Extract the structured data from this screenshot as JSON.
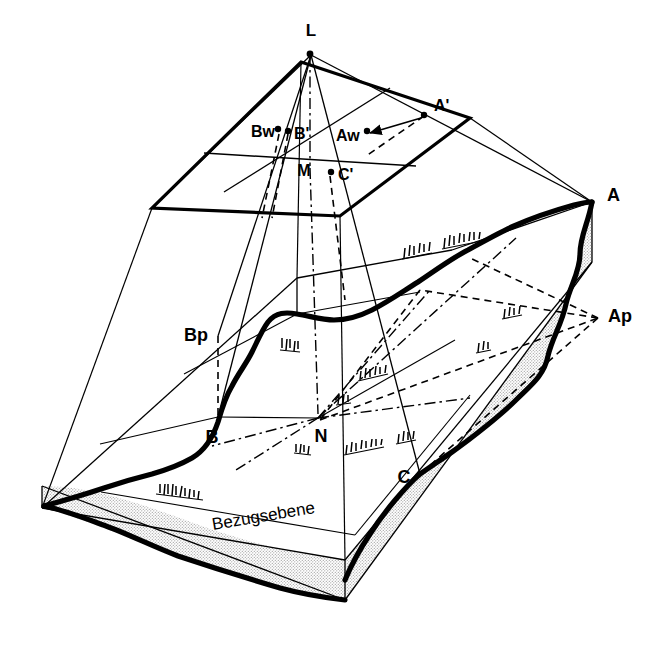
{
  "figure": {
    "domain_note": "photogrammetric central-projection block diagram",
    "background_color": "#ffffff",
    "ink_color": "#000000",
    "stipple_color": "#b8b8b8"
  },
  "labels": {
    "projection_center": "L",
    "image_plane_center": "M",
    "image_point_a": "A'",
    "image_point_b": "B'",
    "image_point_c": "C'",
    "warped_point_a": "Aw",
    "warped_point_b": "Bw",
    "terrain_point_a": "A",
    "terrain_point_b": "B",
    "terrain_point_c": "C",
    "projected_point_a": "Ap",
    "projected_point_b": "Bp",
    "nadir_point": "N",
    "reference_plane": "Bezugsebene"
  },
  "label_positions": {
    "L": {
      "x": 311,
      "y": 36,
      "size": 17,
      "anchor": "middle"
    },
    "Aprime": {
      "x": 438,
      "y": 110,
      "size": 16,
      "anchor": "start"
    },
    "Bw": {
      "x": 253,
      "y": 137,
      "size": 16,
      "anchor": "start"
    },
    "Bprime": {
      "x": 291,
      "y": 139,
      "size": 16,
      "anchor": "start"
    },
    "Aw": {
      "x": 360,
      "y": 139,
      "size": 16,
      "anchor": "start"
    },
    "M": {
      "x": 304,
      "y": 174,
      "size": 16,
      "anchor": "middle"
    },
    "Cprime": {
      "x": 336,
      "y": 178,
      "size": 16,
      "anchor": "start"
    },
    "A": {
      "x": 607,
      "y": 200,
      "size": 17,
      "anchor": "start"
    },
    "Ap": {
      "x": 609,
      "y": 320,
      "size": 17,
      "anchor": "start"
    },
    "Bp": {
      "x": 186,
      "y": 341,
      "size": 17,
      "anchor": "start"
    },
    "B": {
      "x": 211,
      "y": 441,
      "size": 17,
      "anchor": "middle"
    },
    "N": {
      "x": 320,
      "y": 440,
      "size": 17,
      "anchor": "middle"
    },
    "C": {
      "x": 404,
      "y": 483,
      "size": 17,
      "anchor": "middle"
    },
    "Bezugsebene": {
      "x": 213,
      "y": 530,
      "size": 16,
      "anchor": "start",
      "rotate": -17
    }
  },
  "geometry": {
    "image_plane_corners": [
      {
        "x": 301,
        "y": 62
      },
      {
        "x": 470,
        "y": 118
      },
      {
        "x": 340,
        "y": 216
      },
      {
        "x": 152,
        "y": 208
      }
    ],
    "image_plane_midlines": [
      {
        "x1": 204,
        "y1": 154,
        "x2": 415,
        "y2": 166
      },
      {
        "x1": 223,
        "y1": 190,
        "x2": 388,
        "y2": 89
      }
    ],
    "projection_center": {
      "x": 310,
      "y": 52
    },
    "nadir": {
      "x": 318,
      "y": 418
    },
    "block_top_corners": [
      {
        "x": 42,
        "y": 508
      },
      {
        "x": 297,
        "y": 278
      },
      {
        "x": 595,
        "y": 200
      },
      {
        "x": 345,
        "y": 560
      }
    ],
    "block_depth": 60,
    "image_points": [
      {
        "name": "A'",
        "x": 424,
        "y": 114
      },
      {
        "name": "Aw",
        "x": 355,
        "y": 131
      },
      {
        "name": "Bw",
        "x": 278,
        "y": 130
      },
      {
        "name": "B'",
        "x": 288,
        "y": 132
      },
      {
        "name": "C'",
        "x": 330,
        "y": 172
      }
    ],
    "terrain_points": [
      {
        "name": "A",
        "x": 592,
        "y": 202
      },
      {
        "name": "Ap",
        "x": 598,
        "y": 318
      },
      {
        "name": "B",
        "x": 218,
        "y": 417
      },
      {
        "name": "Bp",
        "x": 218,
        "y": 336
      },
      {
        "name": "C",
        "x": 420,
        "y": 474
      }
    ]
  },
  "line_styles": {
    "solid_ray": "solid thin black",
    "hidden_construction": "dashed black",
    "axis": "dash-dot black",
    "terrain_profile": "thick black freehand",
    "block_edge": "thin black"
  }
}
